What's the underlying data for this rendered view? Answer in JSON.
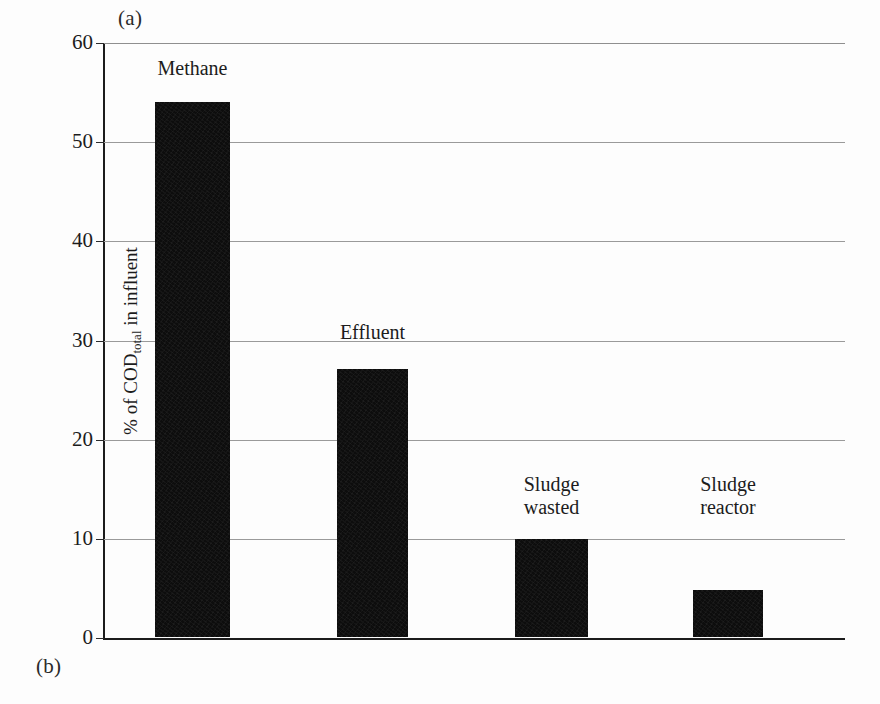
{
  "panels": {
    "top_letter": "(a)",
    "bottom_letter": "(b)"
  },
  "chart_data": {
    "type": "bar",
    "title": "",
    "xlabel": "",
    "ylabel": "% of CODtotal in influent",
    "ylabel_main": "% of COD",
    "ylabel_sub": "total",
    "ylabel_tail": " in influent",
    "categories": [
      "Methane",
      "Effluent",
      "Sludge wasted",
      "Sludge reactor"
    ],
    "values": [
      54,
      27,
      9.9,
      4.7
    ],
    "bar_labels": [
      "Methane",
      "Effluent",
      "Sludge\nwasted",
      "Sludge\nreactor"
    ],
    "ylim": [
      0,
      60
    ],
    "yticks": [
      0,
      10,
      20,
      30,
      40,
      50,
      60
    ],
    "ytick_labels": [
      "0",
      "10",
      "20",
      "30",
      "40",
      "50",
      "60"
    ],
    "grid": true,
    "grid_axis": "y",
    "legend": "none",
    "bar_color": "#0d0d0d",
    "axis_color": "#1c1c1c",
    "grid_color": "#9a9a9a",
    "background_color": "#fdfdfd"
  }
}
